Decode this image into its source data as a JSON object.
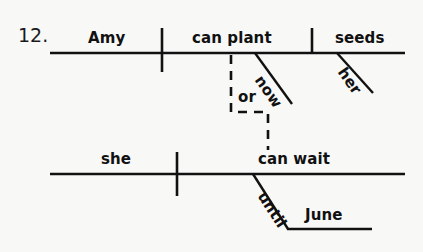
{
  "page": {
    "background_color": "#f8f8f7",
    "ink_color": "#111111",
    "width": 423,
    "height": 252
  },
  "exercise": {
    "number_label": "12.",
    "sentence": "Amy can plant now or she can wait until June, her seeds."
  },
  "diagram": {
    "type": "reed-kellogg-sentence-diagram",
    "clauses": [
      {
        "id": "main-clause-top",
        "baseline": {
          "x1": 50,
          "x2": 405,
          "y": 53
        },
        "subject": {
          "label": "Amy",
          "x": 88,
          "y": 38
        },
        "subject_verb_divider": {
          "x": 162,
          "y1": 28,
          "y2": 72
        },
        "verb": {
          "label": "can plant",
          "x": 192,
          "y": 38
        },
        "direct_object_divider": {
          "x": 312,
          "y1": 28,
          "y2": 53
        },
        "direct_object": {
          "label": "seeds",
          "x": 335,
          "y": 38
        },
        "modifiers": [
          {
            "label": "now",
            "attach": "verb",
            "slant": {
              "x1": 255,
              "y1": 53,
              "x2": 292,
              "y2": 104
            },
            "text_x": 272,
            "text_y": 86,
            "rotation_deg": 55
          },
          {
            "label": "her",
            "attach": "direct-object",
            "slant": {
              "x1": 337,
              "y1": 53,
              "x2": 373,
              "y2": 93
            },
            "text_x": 354,
            "text_y": 76,
            "rotation_deg": 55
          }
        ]
      },
      {
        "id": "main-clause-bottom",
        "baseline": {
          "x1": 50,
          "x2": 405,
          "y": 174
        },
        "subject": {
          "label": "she",
          "x": 101,
          "y": 159
        },
        "subject_verb_divider": {
          "x": 177,
          "y1": 152,
          "y2": 196
        },
        "verb": {
          "label": "can wait",
          "x": 258,
          "y": 159
        },
        "prepositional_phrase": {
          "preposition": {
            "label": "until",
            "text_x": 273,
            "text_y": 203,
            "rotation_deg": 57
          },
          "slant": {
            "x1": 253,
            "y1": 174,
            "x2": 288,
            "y2": 229
          },
          "object": {
            "label": "June",
            "x": 305,
            "y": 215
          },
          "object_line": {
            "x1": 288,
            "x2": 372,
            "y": 229
          }
        }
      }
    ],
    "conjunction": {
      "label": "or",
      "style": "dashed",
      "text_x": 238,
      "text_y": 97,
      "path": [
        {
          "x": 231,
          "y": 55
        },
        {
          "x": 231,
          "y": 112
        },
        {
          "x": 268,
          "y": 112
        },
        {
          "x": 268,
          "y": 150
        }
      ]
    }
  }
}
